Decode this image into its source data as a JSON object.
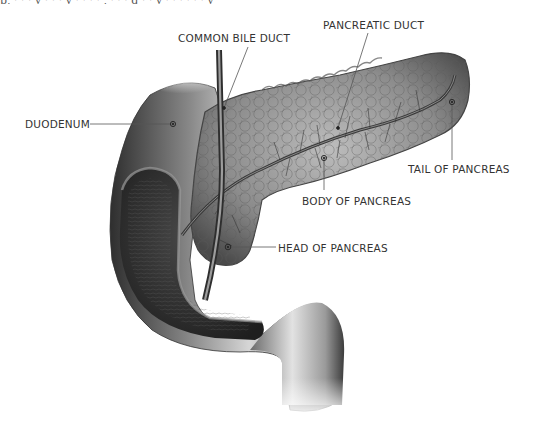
{
  "diagram": {
    "top_cropped_text": "p,  ·  ·  ·  y  ·  ·  ·  y  ·  ·  ·  ·  ,  ·  ·  ·  g  ·  ·  y  ·  ·  ·  ·  ·  ·  y",
    "labels": {
      "common_bile_duct": "COMMON BILE DUCT",
      "pancreatic_duct": "PANCREATIC DUCT",
      "duodenum": "DUODENUM",
      "tail_of_pancreas": "TAIL OF PANCREAS",
      "body_of_pancreas": "BODY OF PANCREAS",
      "head_of_pancreas": "HEAD OF PANCREAS"
    },
    "colors": {
      "label_text": "#333333",
      "leader_line": "#555555",
      "organ_dark": "#3a3a3a",
      "organ_mid": "#7a7a7a",
      "organ_light": "#d8d8d8",
      "background": "#ffffff"
    }
  }
}
